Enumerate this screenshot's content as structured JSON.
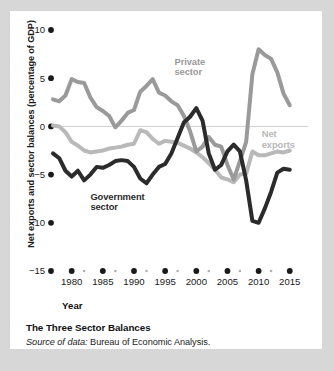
{
  "figure": {
    "caption_title": "The Three Sector Balances",
    "source_prefix": "Source of data:",
    "source_text": "Bureau of Economic Analysis."
  },
  "colors": {
    "government": "#2b2b2b",
    "private": "#9a9a9a",
    "net_exports": "#b9b9b9",
    "zero_line": "#cfcfcf",
    "text": "#1a1a1a",
    "card_background": "#ffffff",
    "page_background": "#d7d7d7"
  },
  "chart_data": {
    "type": "line",
    "title": "The Three Sector Balances",
    "xlabel": "Year",
    "ylabel": "Net exports and sector balances (percentage of GDP)",
    "xlim": [
      1977,
      2016
    ],
    "ylim": [
      -15,
      10
    ],
    "ytick_labels": [
      "10",
      "5",
      "0",
      "-5",
      "-10",
      "-15"
    ],
    "ytick_values": [
      10,
      5,
      0,
      -5,
      -10,
      -15
    ],
    "xtick_labels": [
      "1980",
      "1985",
      "1990",
      "1995",
      "2000",
      "2005",
      "2010",
      "2015"
    ],
    "xtick_values": [
      1980,
      1985,
      1990,
      1995,
      2000,
      2005,
      2010,
      2015
    ],
    "xminor_values": [
      1982,
      1987,
      1992,
      1997,
      2002,
      2007,
      2012
    ],
    "grid": false,
    "zero_line": true,
    "legend": "inline-annotations",
    "annotations": [
      {
        "name": "private-sector",
        "text": "Private sector",
        "x": 1996.5,
        "y": 6.4,
        "color": "#9a9a9a"
      },
      {
        "name": "government-sector",
        "text": "Government sector",
        "x": 1983.0,
        "y": -7.6,
        "color": "#2b2b2b"
      },
      {
        "name": "net-exports",
        "text": "Net exports",
        "x": 2010.5,
        "y": -1.1,
        "color": "#b9b9b9"
      }
    ],
    "x": [
      1977,
      1978,
      1979,
      1980,
      1981,
      1982,
      1983,
      1984,
      1985,
      1986,
      1987,
      1988,
      1989,
      1990,
      1991,
      1992,
      1993,
      1994,
      1995,
      1996,
      1997,
      1998,
      1999,
      2000,
      2001,
      2002,
      2003,
      2004,
      2005,
      2006,
      2007,
      2008,
      2009,
      2010,
      2011,
      2012,
      2013,
      2014,
      2015
    ],
    "series": [
      {
        "name": "Private sector",
        "color": "#9a9a9a",
        "values": [
          2.8,
          2.6,
          3.2,
          4.9,
          4.6,
          4.5,
          3.0,
          2.0,
          1.6,
          1.1,
          -0.1,
          0.6,
          1.4,
          1.7,
          3.6,
          4.2,
          4.9,
          3.5,
          3.2,
          2.6,
          2.2,
          1.1,
          -0.5,
          -2.6,
          -2.1,
          -1.1,
          -1.9,
          -2.1,
          -4.0,
          -5.5,
          -3.6,
          -1.6,
          5.4,
          8.0,
          7.4,
          7.0,
          5.6,
          3.4,
          2.2
        ]
      },
      {
        "name": "Government sector",
        "color": "#2b2b2b",
        "values": [
          -2.8,
          -3.3,
          -4.6,
          -5.2,
          -4.6,
          -5.6,
          -5.0,
          -4.2,
          -4.3,
          -4.0,
          -3.6,
          -3.5,
          -3.6,
          -4.2,
          -5.4,
          -5.9,
          -5.0,
          -4.2,
          -3.9,
          -2.8,
          -1.2,
          0.4,
          1.0,
          1.9,
          0.6,
          -2.8,
          -4.5,
          -4.0,
          -2.6,
          -1.9,
          -2.6,
          -5.6,
          -9.8,
          -10.0,
          -8.5,
          -6.8,
          -4.8,
          -4.4,
          -4.5
        ]
      },
      {
        "name": "Net exports",
        "color": "#b9b9b9",
        "values": [
          0.1,
          0.0,
          -0.6,
          -1.6,
          -2.0,
          -2.5,
          -2.7,
          -2.6,
          -2.5,
          -2.3,
          -2.2,
          -2.1,
          -1.9,
          -1.8,
          -0.4,
          -0.6,
          -1.3,
          -1.8,
          -1.5,
          -1.6,
          -1.7,
          -2.0,
          -2.3,
          -2.7,
          -3.2,
          -3.8,
          -4.5,
          -5.3,
          -5.5,
          -5.8,
          -5.0,
          -4.9,
          -2.6,
          -3.0,
          -3.0,
          -2.8,
          -2.6,
          -2.7,
          -2.5
        ]
      }
    ]
  }
}
